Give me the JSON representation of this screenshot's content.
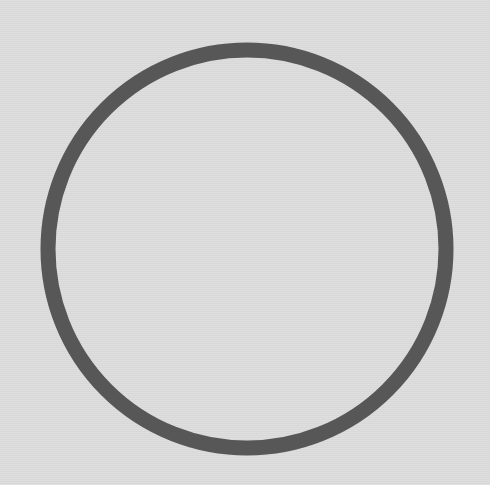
{
  "background": {
    "color": "#dcdcdc"
  },
  "shape": {
    "type": "circle-outline",
    "icon": "circle-outline-icon",
    "center_x": 247,
    "center_y": 249,
    "radius": 199,
    "stroke_width": 15,
    "stroke_color": "#575757"
  }
}
